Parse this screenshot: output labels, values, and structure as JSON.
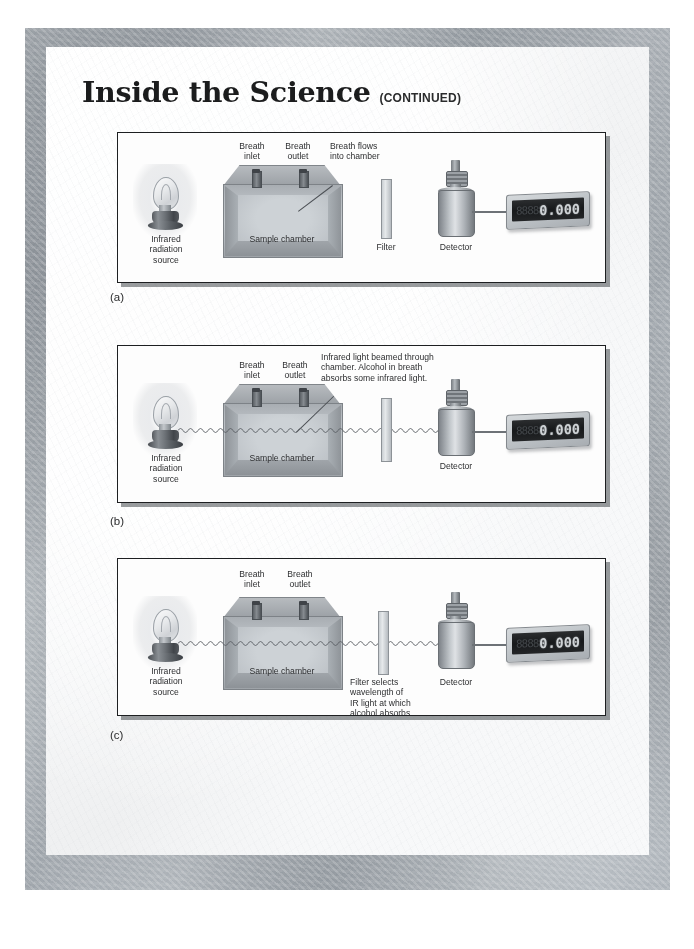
{
  "page": {
    "heading_main": "Inside the Science",
    "heading_continued": "(CONTINUED)"
  },
  "panels": [
    {
      "id": "a",
      "label": "(a)",
      "caption_source": "Infrared\nradiation\nsource",
      "caption_chamber": "Sample chamber",
      "caption_inlet": "Breath\ninlet",
      "caption_outlet": "Breath\noutlet",
      "caption_filter": "Filter",
      "caption_detector": "Detector",
      "annotation": "Breath flows\ninto chamber",
      "display_value": "0.000",
      "display_ghost": "88888",
      "beam_visible": false
    },
    {
      "id": "b",
      "label": "(b)",
      "caption_source": "Infrared\nradiation\nsource",
      "caption_chamber": "Sample chamber",
      "caption_inlet": "Breath\ninlet",
      "caption_outlet": "Breath\noutlet",
      "caption_filter": "",
      "caption_detector": "Detector",
      "annotation": "Infrared light beamed through\nchamber. Alcohol in breath\nabsorbs some infrared light.",
      "display_value": "0.000",
      "display_ghost": "88888",
      "beam_visible": true
    },
    {
      "id": "c",
      "label": "(c)",
      "caption_source": "Infrared\nradiation\nsource",
      "caption_chamber": "Sample chamber",
      "caption_inlet": "Breath\ninlet",
      "caption_outlet": "Breath\noutlet",
      "caption_filter": "Filter selects\nwavelength of\nIR light at which\nalcohol absorbs",
      "caption_detector": "Detector",
      "annotation": "",
      "display_value": "0.000",
      "display_ghost": "88888",
      "beam_visible": true
    }
  ],
  "colors": {
    "frame_gray": "#b0b5ba",
    "page_white": "#f5f6f7",
    "panel_border": "#1d1f21",
    "text_dark": "#2d2e30",
    "display_screen": "#17191b",
    "display_digits": "#cfd3d6"
  }
}
